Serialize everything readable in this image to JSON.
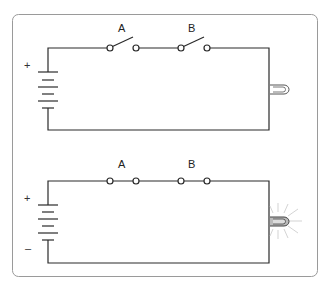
{
  "diagram": {
    "type": "series-circuit-comparison",
    "colors": {
      "wire": "#2a2a2a",
      "frame": "#9a9a9a",
      "bulb_glow": "#c8c8c8",
      "background": "#ffffff"
    },
    "circuits": [
      {
        "id": "open",
        "switches": [
          {
            "label": "A",
            "state": "open"
          },
          {
            "label": "B",
            "state": "open"
          }
        ],
        "battery": {
          "positive_label": "+",
          "negative_label": ""
        },
        "bulb": {
          "state": "off"
        }
      },
      {
        "id": "closed",
        "switches": [
          {
            "label": "A",
            "state": "closed"
          },
          {
            "label": "B",
            "state": "closed"
          }
        ],
        "battery": {
          "positive_label": "+",
          "negative_label": "–"
        },
        "bulb": {
          "state": "lit"
        }
      }
    ]
  }
}
